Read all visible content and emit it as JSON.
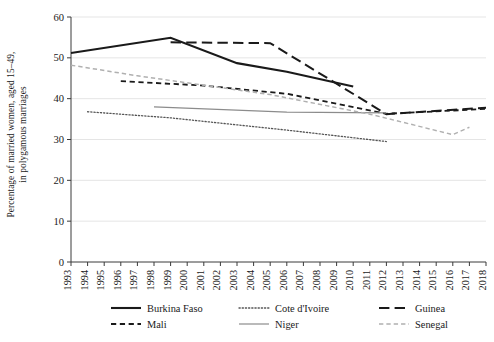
{
  "chart_data": {
    "type": "line",
    "title": "",
    "xlabel": "",
    "ylabel": "Percentage of married women, aged 15–49,\nin polygamous marriages",
    "ylabel_line1": "Percentage of married women, aged 15–49,",
    "ylabel_line2": "in polygamous marriages",
    "xlim": [
      1993,
      2018
    ],
    "ylim": [
      0,
      60
    ],
    "yticks": [
      0,
      10,
      20,
      30,
      40,
      50,
      60
    ],
    "ytick_labels": [
      "0",
      "10",
      "20",
      "30",
      "40",
      "50",
      "60"
    ],
    "xticks": [
      1993,
      1994,
      1995,
      1996,
      1997,
      1998,
      1999,
      2000,
      2001,
      2002,
      2003,
      2004,
      2005,
      2006,
      2007,
      2008,
      2009,
      2010,
      2011,
      2012,
      2013,
      2014,
      2015,
      2016,
      2017,
      2018
    ],
    "xtick_labels": [
      "1993",
      "1994",
      "1995",
      "1996",
      "1997",
      "1998",
      "1999",
      "2000",
      "2001",
      "2002",
      "2003",
      "2004",
      "2005",
      "2006",
      "2007",
      "2008",
      "2009",
      "2010",
      "2011",
      "2012",
      "2013",
      "2014",
      "2015",
      "2016",
      "2017",
      "2018"
    ],
    "grid": "horizontal",
    "legend_position": "below",
    "series": [
      {
        "name": "Burkina Faso",
        "style": "solid",
        "color": "#1a1a1a",
        "width": 2.1,
        "x": [
          1993,
          1999,
          2003,
          2006,
          2010
        ],
        "values": [
          51.2,
          54.9,
          48.7,
          46.6,
          43.0
        ]
      },
      {
        "name": "Cote d'Ivoire",
        "style": "dotted",
        "color": "#555555",
        "width": 1.3,
        "x": [
          1994,
          1999,
          2006,
          2012
        ],
        "values": [
          36.8,
          35.3,
          32.3,
          29.5
        ]
      },
      {
        "name": "Guinea",
        "style": "long-dash",
        "color": "#1a1a1a",
        "width": 2.0,
        "x": [
          1999,
          2005,
          2012,
          2018
        ],
        "values": [
          53.8,
          53.6,
          36.2,
          37.8
        ]
      },
      {
        "name": "Mali",
        "style": "dash",
        "color": "#1a1a1a",
        "width": 1.8,
        "x": [
          1996,
          2001,
          2006,
          2012,
          2018
        ],
        "values": [
          44.3,
          43.2,
          41.2,
          36.3,
          37.5
        ]
      },
      {
        "name": "Niger",
        "style": "solid",
        "color": "#8c8c8c",
        "width": 1.2,
        "x": [
          1998,
          2006,
          2012
        ],
        "values": [
          38.0,
          36.7,
          36.5
        ]
      },
      {
        "name": "Senegal",
        "style": "dash",
        "color": "#b0b0b0",
        "width": 1.5,
        "x": [
          1993,
          1997,
          2005,
          2011,
          2016,
          2017
        ],
        "values": [
          48.2,
          45.6,
          41.0,
          36.2,
          31.2,
          33.0
        ]
      }
    ]
  },
  "legend": {
    "rows": [
      [
        {
          "name": "Burkina Faso",
          "series_index": 0
        },
        {
          "name": "Cote d'Ivoire",
          "series_index": 1
        },
        {
          "name": "Guinea",
          "series_index": 2
        }
      ],
      [
        {
          "name": "Mali",
          "series_index": 3
        },
        {
          "name": "Niger",
          "series_index": 4
        },
        {
          "name": "Senegal",
          "series_index": 5
        }
      ]
    ]
  }
}
